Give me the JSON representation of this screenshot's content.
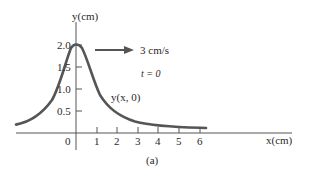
{
  "figure": {
    "caption": "(a)",
    "y_axis_label": "y(cm)",
    "x_axis_label": "x(cm)",
    "origin_label": "0",
    "y_ticks": [
      {
        "label": "2.0",
        "value": 2.0
      },
      {
        "label": "1.5",
        "value": 1.5
      },
      {
        "label": "1.0",
        "value": 1.0
      },
      {
        "label": "0.5",
        "value": 0.5
      }
    ],
    "x_ticks": [
      {
        "label": "1",
        "value": 1
      },
      {
        "label": "2",
        "value": 2
      },
      {
        "label": "3",
        "value": 3
      },
      {
        "label": "4",
        "value": 4
      },
      {
        "label": "5",
        "value": 5
      },
      {
        "label": "6",
        "value": 6
      }
    ],
    "velocity_label": "3 cm/s",
    "time_label": "t = 0",
    "curve_label": "y(x, 0)",
    "colors": {
      "curve": "#555555",
      "axes": "#333333",
      "text": "#2a2a2a"
    }
  }
}
